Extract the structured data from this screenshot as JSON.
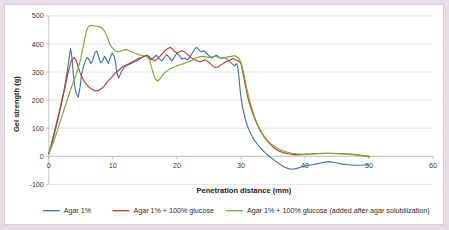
{
  "figure": {
    "background_color": "#e7dce4",
    "card_color": "#ffffff",
    "border_color": "#d9cfd7"
  },
  "chart_data": {
    "type": "line",
    "title": "",
    "xlabel": "Penetration distance (mm)",
    "ylabel": "Gel strength (g)",
    "xlim": [
      0,
      60
    ],
    "ylim": [
      -100,
      500
    ],
    "xticks": [
      0,
      10,
      20,
      30,
      40,
      50,
      60
    ],
    "yticks": [
      -100,
      0,
      100,
      200,
      300,
      400,
      500
    ],
    "xtick_labels": [
      "0",
      "10",
      "20",
      "30",
      "40",
      "50",
      "60"
    ],
    "ytick_labels": [
      "-100",
      "0",
      "100",
      "200",
      "300",
      "400",
      "500"
    ],
    "grid": "horizontal",
    "legend_position": "bottom",
    "series": [
      {
        "name": "Agar 1%",
        "color": "#4472a8",
        "x": [
          0.0,
          0.6,
          1.2,
          1.8,
          2.4,
          3.0,
          3.4,
          3.6,
          3.8,
          4.0,
          4.3,
          4.6,
          4.9,
          5.1,
          5.4,
          5.7,
          6.0,
          6.3,
          6.6,
          6.9,
          7.2,
          7.5,
          7.8,
          8.1,
          8.4,
          8.7,
          9.0,
          9.3,
          9.6,
          9.9,
          10.2,
          10.4,
          10.6,
          10.9,
          11.3,
          11.8,
          12.3,
          12.8,
          13.3,
          13.8,
          14.3,
          14.8,
          15.2,
          15.6,
          16.0,
          16.4,
          16.8,
          17.2,
          17.6,
          18.0,
          18.4,
          18.8,
          19.2,
          19.6,
          20.0,
          20.4,
          20.8,
          21.2,
          21.6,
          22.0,
          22.4,
          22.8,
          23.1,
          23.4,
          23.8,
          24.2,
          24.6,
          25.0,
          25.4,
          25.8,
          26.2,
          26.6,
          27.0,
          27.4,
          27.8,
          28.2,
          28.6,
          29.0,
          29.3,
          29.5,
          29.7,
          29.9,
          30.2,
          30.6,
          31.0,
          31.5,
          32.0,
          32.6,
          33.2,
          33.8,
          34.4,
          35.0,
          35.6,
          36.2,
          36.8,
          37.4,
          38.0,
          38.6,
          39.2,
          39.8,
          40.5,
          41.2,
          42.0,
          42.8,
          43.6,
          44.4,
          45.0,
          45.6,
          46.2,
          46.8,
          47.4,
          48.0,
          48.6,
          49.2,
          49.7,
          50.0
        ],
        "y": [
          10,
          62,
          118,
          176,
          238,
          320,
          384,
          355,
          300,
          258,
          222,
          211,
          248,
          290,
          318,
          340,
          352,
          344,
          330,
          345,
          370,
          375,
          352,
          333,
          340,
          356,
          345,
          330,
          352,
          368,
          356,
          338,
          300,
          278,
          300,
          318,
          325,
          330,
          336,
          340,
          348,
          355,
          360,
          352,
          344,
          352,
          360,
          348,
          340,
          350,
          362,
          352,
          340,
          352,
          368,
          358,
          346,
          350,
          344,
          352,
          368,
          382,
          388,
          380,
          372,
          376,
          368,
          358,
          350,
          356,
          360,
          352,
          348,
          352,
          346,
          338,
          330,
          322,
          330,
          318,
          280,
          230,
          180,
          140,
          108,
          82,
          60,
          42,
          26,
          12,
          0,
          -10,
          -20,
          -30,
          -38,
          -44,
          -46,
          -44,
          -40,
          -36,
          -32,
          -30,
          -26,
          -22,
          -19,
          -21,
          -24,
          -27,
          -29,
          -30,
          -31,
          -32,
          -32,
          -31,
          -31,
          -30
        ],
        "style": "solid"
      },
      {
        "name": "Agar 1% + 100% glucose",
        "color": "#c0392b",
        "x": [
          0.0,
          0.6,
          1.2,
          1.8,
          2.4,
          3.0,
          3.5,
          4.0,
          4.3,
          4.6,
          4.9,
          5.2,
          5.5,
          5.9,
          6.3,
          6.7,
          7.1,
          7.5,
          7.9,
          8.3,
          8.7,
          9.1,
          9.5,
          9.9,
          10.3,
          10.7,
          11.1,
          11.5,
          12.0,
          12.5,
          13.0,
          13.5,
          14.0,
          14.5,
          15.0,
          15.4,
          15.8,
          16.2,
          16.6,
          17.0,
          17.4,
          17.8,
          18.2,
          18.6,
          19.0,
          19.3,
          19.6,
          20.0,
          20.4,
          20.8,
          21.2,
          21.6,
          22.0,
          22.4,
          22.8,
          23.2,
          23.6,
          24.0,
          24.4,
          24.8,
          25.2,
          25.6,
          26.0,
          26.4,
          26.8,
          27.2,
          27.6,
          28.0,
          28.4,
          28.8,
          29.2,
          29.5,
          29.8,
          30.0,
          30.3,
          30.7,
          31.2,
          31.8,
          32.4,
          33.0,
          33.6,
          34.2,
          34.8,
          35.4,
          36.0,
          36.8,
          37.6,
          38.4,
          39.2,
          40.0,
          41.0,
          42.0,
          43.0,
          44.0,
          45.0,
          46.0,
          47.0,
          48.0,
          49.0,
          50.0
        ],
        "y": [
          8,
          55,
          110,
          170,
          232,
          296,
          340,
          352,
          340,
          318,
          296,
          282,
          268,
          256,
          246,
          240,
          234,
          233,
          236,
          242,
          252,
          264,
          274,
          284,
          294,
          302,
          310,
          318,
          324,
          330,
          336,
          342,
          348,
          352,
          356,
          360,
          352,
          344,
          340,
          348,
          358,
          368,
          378,
          384,
          388,
          382,
          374,
          368,
          372,
          376,
          372,
          364,
          356,
          348,
          344,
          340,
          336,
          340,
          344,
          338,
          330,
          322,
          316,
          318,
          324,
          330,
          336,
          340,
          344,
          348,
          344,
          340,
          336,
          332,
          300,
          250,
          198,
          155,
          120,
          92,
          70,
          52,
          38,
          26,
          18,
          12,
          8,
          6,
          6,
          7,
          8,
          10,
          11,
          11,
          10,
          9,
          8,
          6,
          3,
          0
        ],
        "style": "solid"
      },
      {
        "name": "Agar 1% + 100% glucose (added after agar solubilization)",
        "color": "#77ac30",
        "x": [
          0.0,
          0.7,
          1.4,
          2.1,
          2.8,
          3.5,
          4.2,
          4.8,
          5.3,
          5.7,
          6.0,
          6.3,
          6.6,
          6.9,
          7.2,
          7.5,
          7.8,
          8.1,
          8.4,
          8.7,
          9.0,
          9.3,
          9.5,
          9.8,
          10.1,
          10.4,
          10.8,
          11.2,
          11.6,
          12.0,
          12.4,
          12.8,
          13.2,
          13.6,
          14.0,
          14.4,
          14.8,
          15.2,
          15.5,
          15.8,
          16.0,
          16.3,
          16.6,
          17.0,
          17.4,
          17.8,
          18.2,
          18.6,
          19.0,
          19.4,
          19.8,
          20.2,
          20.6,
          21.0,
          21.5,
          22.0,
          22.5,
          23.0,
          23.5,
          24.0,
          24.5,
          25.0,
          25.5,
          26.0,
          26.5,
          27.0,
          27.5,
          28.0,
          28.5,
          29.0,
          29.3,
          29.5,
          29.7,
          30.0,
          30.4,
          30.9,
          31.5,
          32.1,
          32.7,
          33.3,
          34.0,
          34.7,
          35.4,
          36.2,
          37.0,
          38.0,
          39.0,
          40.0,
          41.0,
          42.0,
          43.0,
          44.0,
          45.0,
          46.0,
          47.0,
          48.0,
          49.0,
          49.5,
          50.0
        ],
        "y": [
          12,
          48,
          96,
          146,
          196,
          244,
          286,
          330,
          382,
          430,
          455,
          464,
          466,
          465,
          464,
          463,
          462,
          460,
          455,
          446,
          432,
          414,
          400,
          390,
          382,
          376,
          372,
          374,
          378,
          380,
          378,
          374,
          370,
          366,
          362,
          360,
          358,
          356,
          352,
          340,
          320,
          296,
          276,
          268,
          276,
          290,
          300,
          306,
          312,
          316,
          320,
          324,
          326,
          330,
          334,
          338,
          344,
          350,
          354,
          356,
          354,
          352,
          354,
          356,
          352,
          350,
          352,
          354,
          356,
          358,
          356,
          352,
          346,
          336,
          300,
          242,
          186,
          142,
          108,
          82,
          60,
          44,
          32,
          22,
          16,
          11,
          8,
          7,
          8,
          9,
          10,
          10,
          9,
          8,
          7,
          5,
          2,
          0,
          -3
        ],
        "style": "solid"
      }
    ]
  },
  "legend": {
    "entries": [
      {
        "label": "Agar 1%",
        "color": "#4472a8"
      },
      {
        "label": "Agar 1% + 100% glucose",
        "color": "#c0392b"
      },
      {
        "label": "Agar 1% + 100% glucose (added after agar solubilization)",
        "color": "#77ac30"
      }
    ]
  }
}
